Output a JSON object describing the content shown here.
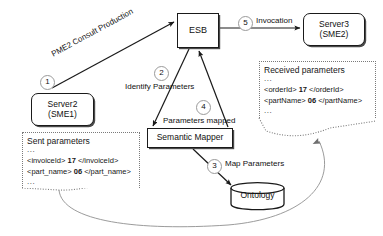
{
  "diagram": {
    "colors": {
      "stroke": "#1a1a1a",
      "badge_ring": "#9a9a9a",
      "doc_border": "#7a7a7a",
      "thin_flow": "#888888",
      "background": "#ffffff"
    }
  },
  "nodes": {
    "esb": {
      "label": "ESB",
      "shape": "rectangle"
    },
    "server3": {
      "line1": "Server3",
      "line2": "(SME2)",
      "shape": "rounded-rectangle"
    },
    "server2": {
      "line1": "Server2",
      "line2": "(SME1)",
      "shape": "rounded-rectangle"
    },
    "mapper": {
      "label": "Semantic Mapper",
      "shape": "rectangle"
    },
    "ontology": {
      "label": "Ontology",
      "shape": "cylinder"
    }
  },
  "steps": [
    {
      "number": "1",
      "label": "PME2 Consult Production",
      "from": "server2",
      "to": "esb"
    },
    {
      "number": "2",
      "label": "Identify Parameters",
      "from": "esb",
      "to": "mapper"
    },
    {
      "number": "3",
      "label": "Map Parameters",
      "from": "mapper",
      "to": "ontology"
    },
    {
      "number": "4",
      "label": "Parameters mapped",
      "from": "mapper",
      "to": "esb"
    },
    {
      "number": "5",
      "label": "Invocation",
      "from": "esb",
      "to": "server3"
    }
  ],
  "documents": {
    "sent": {
      "title": "Sent parameters",
      "ellipsis_top": "...",
      "rows": [
        {
          "open": "<invoiceId>",
          "value": "17",
          "close": "</invoiceId>"
        },
        {
          "open": "<part_name>",
          "value": "06",
          "close": "</part_name>"
        }
      ],
      "ellipsis_bottom": "..."
    },
    "received": {
      "title": "Received parameters",
      "ellipsis_top": "...",
      "rows": [
        {
          "open": "<orderId>",
          "value": "17",
          "close": "</orderId>"
        },
        {
          "open": "<partName>",
          "value": "06",
          "close": "</partName>"
        }
      ],
      "ellipsis_bottom": "..."
    }
  }
}
